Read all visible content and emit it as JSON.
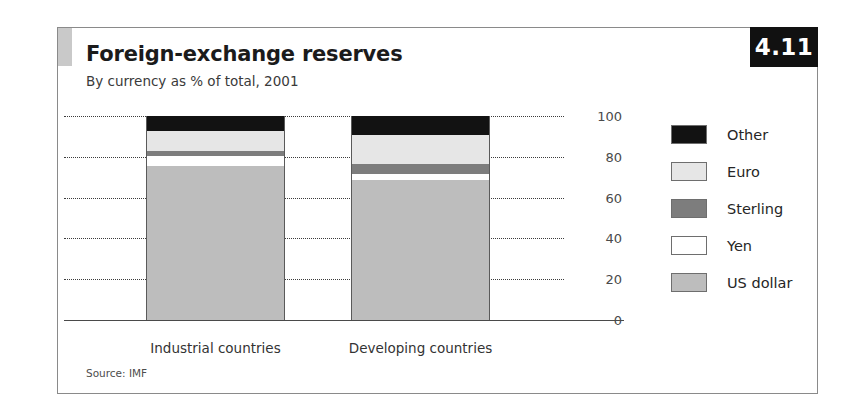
{
  "figure": {
    "number": "4.11",
    "title": "Foreign-exchange reserves",
    "subtitle": "By currency as % of total, 2001",
    "source": "Source: IMF"
  },
  "legend": {
    "position": "right",
    "items": [
      {
        "label": "Other",
        "color": "#121212"
      },
      {
        "label": "Euro",
        "color": "#e6e6e6"
      },
      {
        "label": "Sterling",
        "color": "#7d7d7d"
      },
      {
        "label": "Yen",
        "color": "#ffffff"
      },
      {
        "label": "US dollar",
        "color": "#bdbdbd"
      }
    ]
  },
  "axis": {
    "ticks": [
      "100",
      "80",
      "60",
      "40",
      "20",
      "0"
    ]
  },
  "chart_data": {
    "type": "bar",
    "subtype": "stacked-vertical",
    "title": "Foreign-exchange reserves",
    "subtitle": "By currency as % of total, 2001",
    "xlabel": "",
    "ylabel": "",
    "ylim": [
      0,
      100
    ],
    "yticks": [
      0,
      20,
      40,
      60,
      80,
      100
    ],
    "grid": true,
    "grid_style": "dotted-horizontal",
    "legend_position": "right",
    "categories": [
      "Industrial countries",
      "Developing countries"
    ],
    "series": [
      {
        "name": "US dollar",
        "color": "#bdbdbd",
        "values": [
          75.5,
          68.5
        ]
      },
      {
        "name": "Yen",
        "color": "#ffffff",
        "values": [
          5.0,
          3.0
        ]
      },
      {
        "name": "Sterling",
        "color": "#7d7d7d",
        "values": [
          2.5,
          5.0
        ]
      },
      {
        "name": "Euro",
        "color": "#e6e6e6",
        "values": [
          9.5,
          14.0
        ]
      },
      {
        "name": "Other",
        "color": "#121212",
        "values": [
          7.5,
          9.5
        ]
      }
    ],
    "stack_order_bottom_to_top": [
      "US dollar",
      "Yen",
      "Sterling",
      "Euro",
      "Other"
    ],
    "totals": [
      100,
      100
    ],
    "source": "Source: IMF"
  }
}
